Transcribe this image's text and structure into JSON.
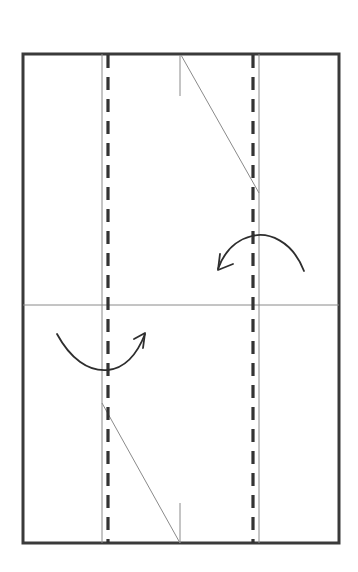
{
  "diagram": {
    "type": "origami-fold-step",
    "colors": {
      "background": "#ffffff",
      "border": "#3a3a3a",
      "crease": "#8a8a8a",
      "valley_fold": "#333333",
      "arrow": "#2e2e2e"
    },
    "paper": {
      "x": 23,
      "y": 54,
      "width": 316,
      "height": 489
    },
    "crease_lines": [
      {
        "id": "left-vertical",
        "x1": 102,
        "y1": 54,
        "x2": 102,
        "y2": 543
      },
      {
        "id": "right-vertical",
        "x1": 259,
        "y1": 54,
        "x2": 259,
        "y2": 543
      },
      {
        "id": "horizontal-center",
        "x1": 23,
        "y1": 305,
        "x2": 339,
        "y2": 305
      },
      {
        "id": "top-tick",
        "x1": 180,
        "y1": 55,
        "x2": 180,
        "y2": 96
      },
      {
        "id": "bottom-tick",
        "x1": 180,
        "y1": 503,
        "x2": 180,
        "y2": 543
      },
      {
        "id": "top-diagonal",
        "x1": 181,
        "y1": 55,
        "x2": 259,
        "y2": 193
      },
      {
        "id": "bottom-diagonal",
        "x1": 102,
        "y1": 403,
        "x2": 180,
        "y2": 543
      }
    ],
    "valley_folds": [
      {
        "id": "left-valley",
        "x": 108,
        "y1": 55,
        "y2": 543
      },
      {
        "id": "right-valley",
        "x": 253,
        "y1": 55,
        "y2": 543
      }
    ],
    "arrows": [
      {
        "id": "fold-arrow-right-to-left",
        "direction": "left",
        "path": "M304,271 C292,240 268,232 252,236 C236,240 224,252 218,269",
        "head": "M220,254 L218,270 L233,264"
      },
      {
        "id": "fold-arrow-left-to-right",
        "direction": "right",
        "path": "M57,334 C70,358 88,372 108,370 C126,368 138,352 145,334",
        "head": "M134,339 L145,333 L143,348"
      }
    ]
  }
}
